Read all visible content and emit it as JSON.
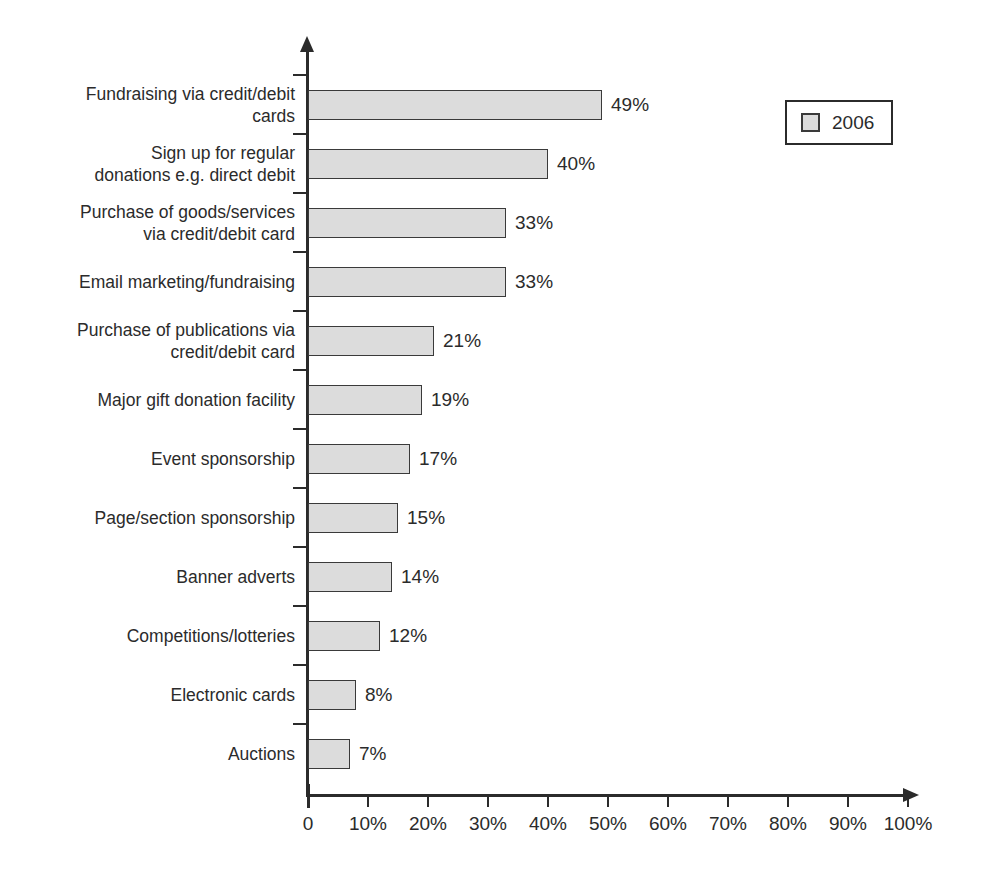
{
  "chart_data": {
    "type": "bar",
    "orientation": "horizontal",
    "title": "",
    "xlabel": "",
    "ylabel": "",
    "xlim": [
      0,
      100
    ],
    "xticks": [
      "0",
      "10%",
      "20%",
      "30%",
      "40%",
      "50%",
      "60%",
      "70%",
      "80%",
      "90%",
      "100%"
    ],
    "grid": false,
    "legend": {
      "position": "top-right",
      "entries": [
        {
          "name": "2006",
          "color": "#dcdcdc"
        }
      ]
    },
    "categories": [
      "Fundraising via credit/debit\ncards",
      "Sign up for regular\ndonations e.g. direct debit",
      "Purchase of goods/services\nvia credit/debit card",
      "Email marketing/fundraising",
      "Purchase of publications via\ncredit/debit card",
      "Major gift donation facility",
      "Event sponsorship",
      "Page/section sponsorship",
      "Banner adverts",
      "Competitions/lotteries",
      "Electronic cards",
      "Auctions"
    ],
    "series": [
      {
        "name": "2006",
        "values": [
          49,
          40,
          33,
          33,
          21,
          19,
          17,
          15,
          14,
          12,
          8,
          7
        ],
        "labels": [
          "49%",
          "40%",
          "33%",
          "33%",
          "21%",
          "19%",
          "17%",
          "15%",
          "14%",
          "12%",
          "8%",
          "7%"
        ]
      }
    ]
  },
  "colors": {
    "bar_fill": "#dcdcdc",
    "bar_stroke": "#3a3a3a",
    "axis": "#2b2b2b",
    "text": "#2b2b2b",
    "background": "#ffffff"
  }
}
